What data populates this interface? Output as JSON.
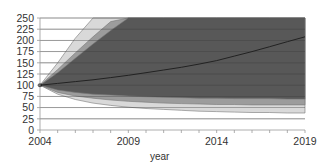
{
  "chart_data": {
    "type": "area",
    "title": "",
    "xlabel": "year",
    "ylabel": "",
    "xlim": [
      2004,
      2019
    ],
    "ylim": [
      0,
      250
    ],
    "x_ticks": [
      2004,
      2009,
      2014,
      2019
    ],
    "y_ticks": [
      0,
      25,
      50,
      75,
      100,
      125,
      150,
      175,
      200,
      225,
      250
    ],
    "grid": true,
    "legend": null,
    "x": [
      2004,
      2005,
      2006,
      2007,
      2008,
      2009,
      2010,
      2011,
      2012,
      2013,
      2014,
      2015,
      2016,
      2017,
      2018,
      2019
    ],
    "series": [
      {
        "name": "central projection",
        "kind": "line",
        "color": "#2a2a2a",
        "values": [
          100,
          104,
          108,
          112,
          117,
          122,
          128,
          134,
          140,
          147,
          155,
          165,
          175,
          186,
          197,
          208
        ]
      },
      {
        "name": "inner band upper",
        "kind": "band-upper",
        "color": "#5a5a5a",
        "values": [
          100,
          128,
          160,
          192,
          222,
          250,
          250,
          250,
          250,
          250,
          250,
          250,
          250,
          250,
          250,
          250
        ]
      },
      {
        "name": "inner band lower",
        "kind": "band-lower",
        "color": "#5a5a5a",
        "values": [
          100,
          89,
          84,
          80,
          78,
          76,
          74,
          73,
          72,
          71,
          71,
          70,
          70,
          70,
          69,
          69
        ]
      },
      {
        "name": "middle band upper",
        "kind": "band-upper",
        "color": "#9a9a9a",
        "values": [
          100,
          135,
          172,
          208,
          242,
          250,
          250,
          250,
          250,
          250,
          250,
          250,
          250,
          250,
          250,
          250
        ]
      },
      {
        "name": "middle band lower",
        "kind": "band-lower",
        "color": "#9a9a9a",
        "values": [
          100,
          84,
          76,
          71,
          67,
          64,
          62,
          60,
          59,
          58,
          57,
          57,
          56,
          56,
          56,
          56
        ]
      },
      {
        "name": "outer band upper",
        "kind": "band-upper",
        "color": "#d6d6d6",
        "values": [
          100,
          150,
          205,
          250,
          250,
          250,
          250,
          250,
          250,
          250,
          250,
          250,
          250,
          250,
          250,
          250
        ]
      },
      {
        "name": "outer band lower",
        "kind": "band-lower",
        "color": "#d6d6d6",
        "values": [
          100,
          80,
          68,
          60,
          55,
          51,
          48,
          46,
          44,
          42,
          41,
          40,
          39,
          39,
          38,
          38
        ]
      }
    ]
  }
}
